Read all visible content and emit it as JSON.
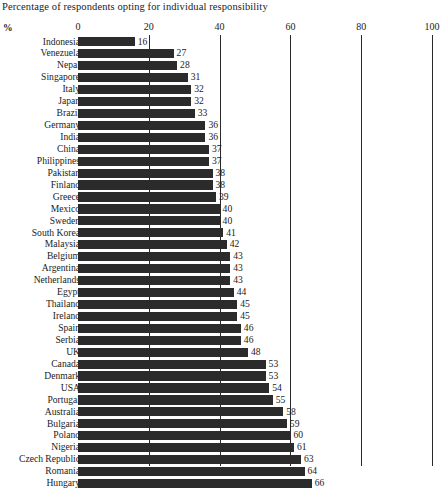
{
  "chart_data": {
    "type": "bar",
    "orientation": "horizontal",
    "title": "Percentage of respondents opting for individual responsibility",
    "xlabel": "%",
    "ylabel": "",
    "xlim": [
      0,
      100
    ],
    "xticks": [
      0,
      20,
      40,
      60,
      80,
      100
    ],
    "xtick_labels": [
      "0",
      "20",
      "40",
      "60",
      "80",
      "100"
    ],
    "grid": false,
    "legend": null,
    "bar_color": "#2b2b2b",
    "categories": [
      "Indonesia",
      "Venezuela",
      "Nepal",
      "Singapore",
      "Italy",
      "Japan",
      "Brazil",
      "Germany",
      "India",
      "China",
      "Philippines",
      "Pakistan",
      "Finland",
      "Greece",
      "Mexico",
      "Sweden",
      "South Korea",
      "Malaysia",
      "Belgium",
      "Argentina",
      "Netherlands",
      "Egypt",
      "Thailand",
      "Ireland",
      "Spain",
      "Serbia",
      "UK",
      "Canada",
      "Denmark",
      "USA",
      "Portugal",
      "Australia",
      "Bulgaria",
      "Poland",
      "Nigeria",
      "Czech Republic",
      "Romania",
      "Hungary"
    ],
    "values": [
      16,
      27,
      28,
      31,
      32,
      32,
      33,
      36,
      36,
      37,
      37,
      38,
      38,
      39,
      40,
      40,
      41,
      42,
      43,
      43,
      43,
      44,
      45,
      45,
      46,
      46,
      48,
      53,
      53,
      54,
      55,
      58,
      59,
      60,
      61,
      63,
      64,
      66
    ]
  }
}
